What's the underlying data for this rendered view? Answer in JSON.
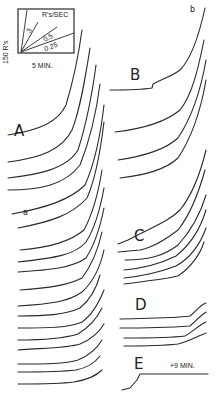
{
  "figure": {
    "calibration": {
      "vertical_scale": "150 R's",
      "horizontal_scale": "5 MIN.",
      "rate_label": "R's/SEC",
      "rate_ticks": [
        "3",
        "0.5",
        "0.25"
      ]
    },
    "panels": {
      "A": "A",
      "B": "B",
      "C": "C",
      "D": "D",
      "E": "E"
    },
    "annotations": {
      "a": "a",
      "b": "b",
      "E_note": "+9 MIN."
    },
    "stroke_color": "#2a2a2a",
    "background": "#ffffff"
  },
  "curves": {
    "left_column": [
      "M82,30 C78,60 72,85 66,105 C58,122 40,130 8,135",
      "M90,48 C85,80 80,110 72,130 C62,150 40,158 8,162",
      "M96,65 C92,95 86,125 78,150 C66,170 35,175 8,178",
      "M100,84 C96,115 90,140 80,165 C65,185 40,190 8,190",
      "M104,105 C100,140 94,165 85,185 C70,200 45,208 12,214",
      "M104,122 C100,155 95,180 87,198 C72,215 50,222 18,228",
      "M102,170 C98,195 92,215 84,230 C70,242 45,248 20,250",
      "M104,188 C100,210 95,228 86,242 C75,255 55,258 18,262",
      "M104,208 C100,228 95,244 86,258 C72,268 50,270 18,272",
      "M102,232 C98,250 92,265 82,278 C68,285 50,288 20,290",
      "M104,250 C100,268 93,282 82,292 C68,302 50,304 18,306",
      "M100,275 C96,290 90,300 80,308 C65,315 45,316 18,316",
      "M104,290 C98,305 92,315 82,322 C70,328 45,328 18,328",
      "M102,308 C96,320 88,328 78,334 C65,338 40,340 18,340",
      "M104,324 C98,334 90,340 80,344 C68,348 45,348 18,350",
      "M102,340 C96,350 88,356 78,360 C65,364 45,364 18,364",
      "M100,356 C94,364 86,368 76,370 C60,372 40,372 18,372",
      "M102,370 C96,376 86,380 74,382 C60,384 40,384 18,384"
    ],
    "right_column": [
      "M205,8 C198,40 190,60 180,70 C172,76 165,78 153,84 L152,88 C140,90 125,90 110,90",
      "M204,40 C198,70 192,95 180,110 C168,120 150,128 115,132",
      "M206,60 C200,95 190,120 178,138 C165,150 145,156 118,160",
      "M206,80 C200,115 190,140 178,158 C165,170 145,175 120,178",
      "M206,150 C200,175 192,195 180,210 C168,222 150,228 128,240 L118,244",
      "M205,170 C198,195 190,215 178,230 C165,240 150,248 140,250 L118,252",
      "M206,195 C200,215 190,232 178,245 C165,255 150,260 125,260",
      "M206,210 C200,230 190,245 176,256 C160,264 145,268 124,270",
      "M206,228 C200,245 190,258 176,266 C160,272 145,276 124,278",
      "M204,242 C200,255 190,268 178,276 L168,278 C155,280 140,282 124,284",
      "M206,303 C200,305 195,312 190,316 C175,318 160,318 120,319",
      "M206,312 C200,316 195,322 190,326 C175,327 160,328 120,328",
      "M206,322 C198,326 192,332 185,336 C170,338 150,338 124,338",
      "M206,333 C198,336 188,342 178,344 C160,346 145,346 124,346",
      "M208,374 L140,374 L137,380 L130,388 L122,390"
    ]
  }
}
